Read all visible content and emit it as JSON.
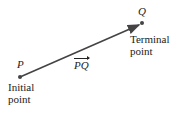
{
  "diagram": {
    "start_point": {
      "label": "P",
      "caption_line1": "Initial",
      "caption_line2": "point"
    },
    "end_point": {
      "label": "Q",
      "caption_line1": "Terminal",
      "caption_line2": "point"
    },
    "vector_label": "PQ",
    "colors": {
      "line": "#444444",
      "text": "#222222"
    }
  }
}
